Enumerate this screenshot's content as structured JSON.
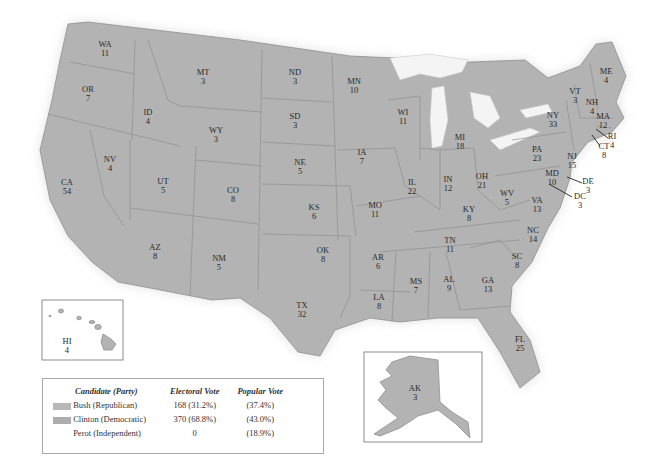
{
  "map": {
    "title": "1992 Presidential Election Electoral Map",
    "fill_color": "#b3b3b3",
    "states": [
      {
        "abbr": "WA",
        "ev": "11",
        "x": 105,
        "y": 45
      },
      {
        "abbr": "OR",
        "ev": "7",
        "x": 88,
        "y": 90
      },
      {
        "abbr": "ID",
        "ev": "4",
        "x": 148,
        "y": 113
      },
      {
        "abbr": "MT",
        "ev": "3",
        "x": 203,
        "y": 73
      },
      {
        "abbr": "WY",
        "ev": "3",
        "x": 216,
        "y": 131
      },
      {
        "abbr": "ND",
        "ev": "3",
        "x": 295,
        "y": 73
      },
      {
        "abbr": "SD",
        "ev": "3",
        "x": 295,
        "y": 117
      },
      {
        "abbr": "MN",
        "ev": "10",
        "x": 354,
        "y": 82
      },
      {
        "abbr": "WI",
        "ev": "11",
        "x": 403,
        "y": 113
      },
      {
        "abbr": "MI",
        "ev": "18",
        "x": 460,
        "y": 138
      },
      {
        "abbr": "NV",
        "ev": "4",
        "x": 110,
        "y": 160
      },
      {
        "abbr": "CA",
        "ev": "54",
        "x": 67,
        "y": 183
      },
      {
        "abbr": "UT",
        "ev": "5",
        "x": 163,
        "y": 182
      },
      {
        "abbr": "CO",
        "ev": "8",
        "x": 233,
        "y": 191
      },
      {
        "abbr": "NE",
        "ev": "5",
        "x": 300,
        "y": 163
      },
      {
        "abbr": "IA",
        "ev": "7",
        "x": 362,
        "y": 153
      },
      {
        "abbr": "IL",
        "ev": "22",
        "x": 412,
        "y": 183
      },
      {
        "abbr": "IN",
        "ev": "12",
        "x": 448,
        "y": 180
      },
      {
        "abbr": "OH",
        "ev": "21",
        "x": 482,
        "y": 177
      },
      {
        "abbr": "KS",
        "ev": "6",
        "x": 314,
        "y": 208
      },
      {
        "abbr": "MO",
        "ev": "11",
        "x": 375,
        "y": 206
      },
      {
        "abbr": "KY",
        "ev": "8",
        "x": 469,
        "y": 210
      },
      {
        "abbr": "WV",
        "ev": "5",
        "x": 507,
        "y": 194
      },
      {
        "abbr": "VA",
        "ev": "13",
        "x": 537,
        "y": 201
      },
      {
        "abbr": "AZ",
        "ev": "8",
        "x": 155,
        "y": 248
      },
      {
        "abbr": "NM",
        "ev": "5",
        "x": 219,
        "y": 259
      },
      {
        "abbr": "OK",
        "ev": "8",
        "x": 323,
        "y": 251
      },
      {
        "abbr": "AR",
        "ev": "6",
        "x": 378,
        "y": 258
      },
      {
        "abbr": "TN",
        "ev": "11",
        "x": 450,
        "y": 241
      },
      {
        "abbr": "NC",
        "ev": "14",
        "x": 533,
        "y": 231
      },
      {
        "abbr": "SC",
        "ev": "8",
        "x": 517,
        "y": 257
      },
      {
        "abbr": "MS",
        "ev": "7",
        "x": 416,
        "y": 282
      },
      {
        "abbr": "AL",
        "ev": "9",
        "x": 449,
        "y": 280
      },
      {
        "abbr": "GA",
        "ev": "13",
        "x": 488,
        "y": 281
      },
      {
        "abbr": "TX",
        "ev": "32",
        "x": 302,
        "y": 306
      },
      {
        "abbr": "LA",
        "ev": "8",
        "x": 379,
        "y": 298
      },
      {
        "abbr": "FL",
        "ev": "25",
        "x": 520,
        "y": 340
      },
      {
        "abbr": "PA",
        "ev": "23",
        "x": 537,
        "y": 150
      },
      {
        "abbr": "NY",
        "ev": "33",
        "x": 553,
        "y": 116
      },
      {
        "abbr": "VT",
        "ev": "3",
        "x": 575,
        "y": 92
      },
      {
        "abbr": "NH",
        "ev": "4",
        "x": 592,
        "y": 103
      },
      {
        "abbr": "ME",
        "ev": "4",
        "x": 606,
        "y": 72
      },
      {
        "abbr": "MA",
        "ev": "12",
        "x": 603,
        "y": 117
      },
      {
        "abbr": "NJ",
        "ev": "15",
        "x": 572,
        "y": 157
      },
      {
        "abbr": "MD",
        "ev": "10",
        "x": 552,
        "y": 174
      }
    ],
    "callouts": [
      {
        "abbr": "RI",
        "ev": "4",
        "x": 612,
        "y": 137
      },
      {
        "abbr": "CT",
        "ev": "8",
        "x": 604,
        "y": 147
      },
      {
        "abbr": "DE",
        "ev": "3",
        "x": 588,
        "y": 182
      },
      {
        "abbr": "DC",
        "ev": "3",
        "x": 580,
        "y": 197
      }
    ],
    "insets": {
      "hawaii": {
        "abbr": "HI",
        "ev": "4"
      },
      "alaska": {
        "abbr": "AK",
        "ev": "3"
      }
    }
  },
  "legend": {
    "headers": {
      "candidate": "Candidate (Party)",
      "electoral": "Electoral Vote",
      "popular": "Popular Vote"
    },
    "rows": [
      {
        "candidate": "Bush (Republican)",
        "electoral": "168 (31.2%)",
        "popular": "(37.4%)",
        "swatch": "#b8b8b8"
      },
      {
        "candidate": "Clinton (Democratic)",
        "electoral": "370 (68.8%)",
        "popular": "(43.0%)",
        "swatch": "#b0b0b0"
      },
      {
        "candidate": "Perot (Independent)",
        "electoral": "0",
        "popular": "(18.9%)",
        "swatch": ""
      }
    ]
  }
}
